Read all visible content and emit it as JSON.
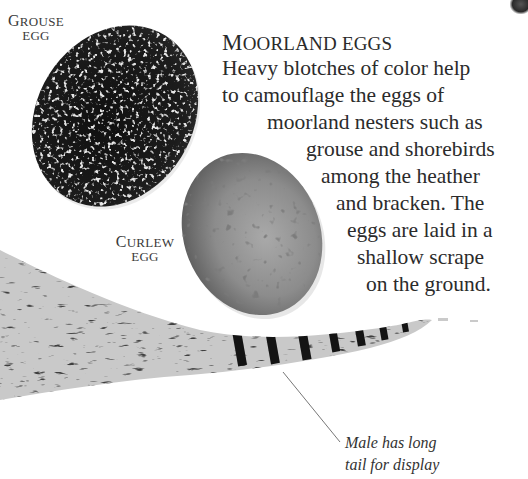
{
  "page": {
    "heading": {
      "first_letter": "M",
      "rest": "OORLAND EGGS"
    },
    "body_lines": [
      "Heavy blotches of color help",
      "to camouflage the eggs of",
      "moorland nesters such as",
      "grouse and shorebirds",
      "among the heather",
      "and bracken. The",
      "eggs are laid in a",
      "shallow scrape",
      "on the ground."
    ],
    "labels": {
      "grouse": {
        "first_letter": "G",
        "rest": "ROUSE",
        "line2": "EGG"
      },
      "curlew": {
        "first_letter": "C",
        "rest": "URLEW",
        "line2": "EGG"
      }
    },
    "caption": {
      "line1": "Male has long",
      "line2": "tail for display"
    },
    "images": {
      "grouse_egg": "grouse-egg-photo",
      "curlew_egg": "curlew-egg-photo",
      "tail_feather": "pheasant-tail-feather-photo"
    },
    "colors": {
      "text": "#2b2b2b",
      "grouse_egg_base": "#151515",
      "curlew_egg_base": "#8a8a8a",
      "leader_line": "#777777"
    }
  }
}
